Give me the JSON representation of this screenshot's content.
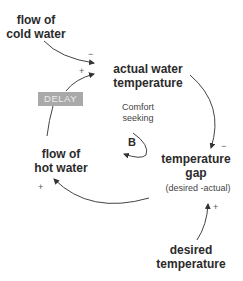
{
  "diagram": {
    "type": "causal-loop-diagram",
    "nodes": {
      "cold_water": {
        "line1": "flow of",
        "line2": "cold water"
      },
      "actual_temp": {
        "line1": "actual water",
        "line2": "temperature"
      },
      "temp_gap": {
        "line1": "temperature",
        "line2": "gap",
        "note": "(desired -actual)"
      },
      "desired_temp": {
        "line1": "desired",
        "line2": "temperature"
      },
      "hot_water": {
        "line1": "flow of",
        "line2": "hot water"
      }
    },
    "delay": {
      "label": "DELAY",
      "color": "#a9a9a9"
    },
    "loop": {
      "label_line1": "Comfort",
      "label_line2": "seeking",
      "type": "B"
    },
    "polarities": {
      "cold_to_actual": "−",
      "hot_to_actual": "+",
      "actual_to_gap": "−",
      "desired_to_gap": "+",
      "gap_to_hot": "+"
    },
    "edges": [
      {
        "from": "flow of cold water",
        "to": "actual water temperature",
        "polarity": "−"
      },
      {
        "from": "flow of hot water",
        "to": "actual water temperature",
        "polarity": "+",
        "delay": true
      },
      {
        "from": "actual water temperature",
        "to": "temperature gap",
        "polarity": "−"
      },
      {
        "from": "desired temperature",
        "to": "temperature gap",
        "polarity": "+"
      },
      {
        "from": "temperature gap",
        "to": "flow of hot water",
        "polarity": "+"
      }
    ]
  }
}
